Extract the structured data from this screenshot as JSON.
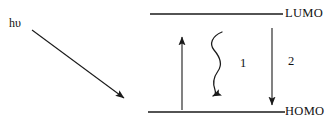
{
  "figure": {
    "type": "energy-level-diagram",
    "background_color": "#ffffff",
    "stroke_color": "#1a1a1a",
    "text_color": "#111111"
  },
  "levels": {
    "lumo": {
      "label": "LUMO",
      "y": 14,
      "x_start": 150,
      "x_end": 283
    },
    "homo": {
      "label": "HOMO",
      "y": 112,
      "x_start": 148,
      "x_end": 285
    }
  },
  "photon": {
    "label": "hυ",
    "arrow": {
      "x1": 32,
      "y1": 30,
      "x2": 128,
      "y2": 101,
      "style": "straight",
      "head": "end"
    }
  },
  "transitions": [
    {
      "name": "excitation",
      "label": "",
      "direction": "up",
      "style": "straight",
      "x": 182,
      "y_start": 110,
      "y_end": 33
    },
    {
      "name": "internal-conversion",
      "label": "1",
      "direction": "down",
      "style": "wavy",
      "x": 215,
      "y_start": 32,
      "y_end": 96
    },
    {
      "name": "emission",
      "label": "2",
      "direction": "down",
      "style": "straight",
      "x": 272,
      "y_start": 28,
      "y_end": 109
    }
  ],
  "annotations": {
    "process_1": "1",
    "process_2": "2"
  }
}
